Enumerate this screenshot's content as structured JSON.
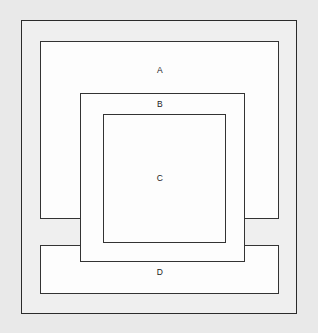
{
  "diagram": {
    "type": "nested-rectangles",
    "background_color": "#e9e9e9",
    "stroke_color": "#333333",
    "fill_color": "#fdfdfd",
    "label_color": "#1a1a1a",
    "canvas": {
      "width": 318,
      "height": 333
    },
    "shapes": [
      {
        "id": "outer",
        "label": "",
        "x": 21,
        "y": 20,
        "width": 276,
        "height": 294
      },
      {
        "id": "a",
        "label": "A",
        "x": 40,
        "y": 41,
        "width": 239,
        "height": 178
      },
      {
        "id": "b",
        "label": "B",
        "x": 80,
        "y": 93,
        "width": 165,
        "height": 169
      },
      {
        "id": "c",
        "label": "C",
        "x": 103,
        "y": 114,
        "width": 123,
        "height": 129
      },
      {
        "id": "d",
        "label": "D",
        "x": 40,
        "y": 245,
        "width": 239,
        "height": 49
      }
    ],
    "labels": {
      "a": "A",
      "b": "B",
      "c": "C",
      "d": "D"
    }
  }
}
